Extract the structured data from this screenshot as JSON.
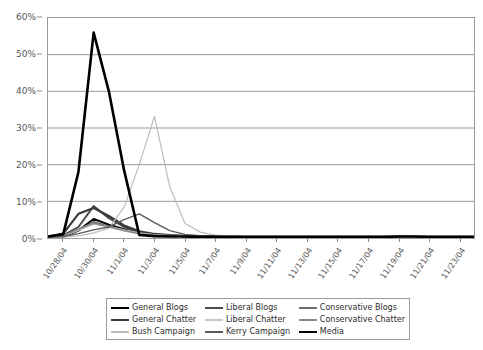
{
  "chart_data": {
    "type": "line",
    "title": "",
    "subtitle": "",
    "xlabel": "",
    "ylabel": "",
    "ylim": [
      0,
      60
    ],
    "ytick_values": [
      0,
      10,
      20,
      30,
      40,
      50,
      60
    ],
    "ytick_labels": [
      "0%",
      "10%",
      "20%",
      "30%",
      "40%",
      "50%",
      "60%"
    ],
    "grid": true,
    "legend_position": "bottom",
    "x": [
      "10/27/04",
      "10/28/04",
      "10/29/04",
      "10/30/04",
      "10/31/04",
      "11/1/04",
      "11/2/04",
      "11/3/04",
      "11/4/04",
      "11/5/04",
      "11/6/04",
      "11/7/04",
      "11/8/04",
      "11/9/04",
      "11/10/04",
      "11/11/04",
      "11/12/04",
      "11/13/04",
      "11/14/04",
      "11/15/04",
      "11/16/04",
      "11/17/04",
      "11/18/04",
      "11/19/04",
      "11/20/04",
      "11/21/04",
      "11/22/04",
      "11/23/04",
      "11/24/04"
    ],
    "xtick_labels": [
      "10/28/04",
      "10/30/04",
      "11/1/04",
      "11/3/04",
      "11/5/04",
      "11/7/04",
      "11/9/04",
      "11/11/04",
      "11/13/04",
      "11/15/04",
      "11/17/04",
      "11/19/04",
      "11/21/04",
      "11/23/04"
    ],
    "xtick_indices": [
      1,
      3,
      5,
      7,
      9,
      11,
      13,
      15,
      17,
      19,
      21,
      23,
      25,
      27
    ],
    "series": [
      {
        "name": "General Blogs",
        "color": "#000000",
        "width": 2.0,
        "values": [
          0.2,
          0.4,
          2.0,
          5.2,
          3.6,
          2.4,
          1.4,
          0.9,
          0.6,
          0.5,
          0.4,
          0.3,
          0.3,
          0.3,
          0.2,
          0.2,
          0.2,
          0.2,
          0.2,
          0.2,
          0.2,
          0.2,
          0.2,
          0.3,
          0.3,
          0.2,
          0.2,
          0.2,
          0.2
        ]
      },
      {
        "name": "Liberal Blogs",
        "color": "#4d4d4d",
        "width": 2.0,
        "values": [
          0.3,
          0.7,
          3.0,
          8.7,
          5.4,
          3.0,
          1.6,
          1.0,
          0.7,
          0.5,
          0.4,
          0.4,
          0.3,
          0.3,
          0.3,
          0.2,
          0.2,
          0.2,
          0.2,
          0.2,
          0.2,
          0.2,
          0.2,
          0.3,
          0.3,
          0.2,
          0.2,
          0.2,
          0.2
        ]
      },
      {
        "name": "Conservative Blogs",
        "color": "#6e6e6e",
        "width": 1.6,
        "values": [
          0.2,
          0.5,
          2.2,
          4.4,
          3.2,
          2.2,
          1.3,
          0.8,
          0.6,
          0.5,
          0.4,
          0.3,
          0.3,
          0.3,
          0.2,
          0.2,
          0.2,
          0.2,
          0.2,
          0.2,
          0.2,
          0.2,
          0.2,
          0.3,
          0.3,
          0.2,
          0.2,
          0.2,
          0.2
        ]
      },
      {
        "name": "General Chatter",
        "color": "#3a3a3a",
        "width": 2.2,
        "values": [
          0.4,
          1.2,
          6.6,
          8.2,
          6.0,
          3.4,
          1.8,
          1.1,
          0.8,
          0.6,
          0.5,
          0.4,
          0.4,
          0.3,
          0.3,
          0.3,
          0.3,
          0.3,
          0.3,
          0.3,
          0.3,
          0.3,
          0.3,
          0.4,
          0.4,
          0.3,
          0.3,
          0.3,
          0.3
        ]
      },
      {
        "name": "Liberal Chatter",
        "color": "#c8c8c8",
        "width": 1.4,
        "values": [
          0.2,
          0.5,
          2.1,
          3.8,
          3.1,
          2.2,
          1.4,
          0.9,
          0.6,
          0.5,
          0.4,
          0.3,
          0.3,
          0.3,
          0.2,
          0.2,
          0.2,
          0.2,
          0.2,
          0.2,
          0.2,
          0.2,
          0.2,
          0.3,
          0.3,
          0.2,
          0.2,
          0.2,
          0.2
        ]
      },
      {
        "name": "Conservative Chatter",
        "color": "#8a8a8a",
        "width": 1.6,
        "values": [
          0.2,
          0.6,
          2.4,
          4.0,
          3.0,
          2.0,
          1.2,
          0.8,
          0.6,
          0.5,
          0.4,
          0.3,
          0.3,
          0.3,
          0.2,
          0.2,
          0.2,
          0.2,
          0.2,
          0.2,
          0.2,
          0.2,
          0.2,
          0.3,
          0.3,
          0.2,
          0.2,
          0.2,
          0.2
        ]
      },
      {
        "name": "Bush Campaign",
        "color": "#bdbdbd",
        "width": 1.2,
        "values": [
          0.1,
          0.2,
          0.6,
          1.4,
          2.6,
          8.4,
          20.0,
          33.2,
          14.0,
          4.0,
          1.6,
          0.8,
          0.5,
          0.4,
          0.3,
          0.3,
          0.2,
          0.2,
          0.2,
          0.2,
          0.2,
          0.2,
          0.2,
          0.2,
          0.2,
          0.2,
          0.2,
          0.2,
          0.2
        ]
      },
      {
        "name": "Kerry Campaign",
        "color": "#5a5a5a",
        "width": 1.4,
        "values": [
          0.2,
          0.4,
          1.2,
          2.2,
          3.0,
          5.0,
          6.6,
          4.2,
          2.0,
          1.0,
          0.6,
          0.5,
          0.4,
          0.3,
          0.3,
          0.3,
          0.2,
          0.2,
          0.2,
          0.2,
          0.2,
          0.2,
          0.2,
          0.3,
          0.3,
          0.2,
          0.2,
          0.2,
          0.2
        ]
      },
      {
        "name": "Media",
        "color": "#000000",
        "width": 2.6,
        "values": [
          0.4,
          1.0,
          18.0,
          56.0,
          40.0,
          18.5,
          0.8,
          0.5,
          0.4,
          0.4,
          0.3,
          0.3,
          0.3,
          0.3,
          0.3,
          0.3,
          0.3,
          0.3,
          0.3,
          0.3,
          0.3,
          0.3,
          0.3,
          0.4,
          0.4,
          0.3,
          0.3,
          0.3,
          0.3
        ]
      }
    ]
  },
  "legend": {
    "items": [
      {
        "label": "General Blogs",
        "color": "#000000",
        "width": 2.6
      },
      {
        "label": "Liberal Blogs",
        "color": "#4d4d4d",
        "width": 2.4
      },
      {
        "label": "Conservative Blogs",
        "color": "#6e6e6e",
        "width": 2.0
      },
      {
        "label": "General Chatter",
        "color": "#3a3a3a",
        "width": 2.6
      },
      {
        "label": "Liberal Chatter",
        "color": "#c8c8c8",
        "width": 1.8
      },
      {
        "label": "Conservative Chatter",
        "color": "#8a8a8a",
        "width": 2.0
      },
      {
        "label": "Bush Campaign",
        "color": "#bdbdbd",
        "width": 1.4
      },
      {
        "label": "Kerry Campaign",
        "color": "#5a5a5a",
        "width": 1.8
      },
      {
        "label": "Media",
        "color": "#000000",
        "width": 2.8
      }
    ]
  },
  "style": {
    "grid_color": "#9a9a9a",
    "axis_color": "#8d8d8d",
    "text_color": "#595959",
    "plot_border_color": "#9a9a9a",
    "background": "#ffffff"
  }
}
